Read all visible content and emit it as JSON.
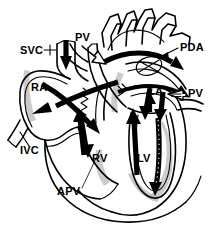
{
  "figure": {
    "type": "line-drawing",
    "background_color": "#ffffff",
    "ink_color": "#000000",
    "shade_color": "#b9b9b9",
    "width": 211,
    "height": 226
  },
  "labels": [
    {
      "id": "svc",
      "text": "SVC",
      "x": 20,
      "y": 54,
      "meaning": "superior-vena-cava"
    },
    {
      "id": "pv_top",
      "text": "PV",
      "x": 75,
      "y": 41,
      "meaning": "pulmonary-vein-upper"
    },
    {
      "id": "pda",
      "text": "PDA",
      "x": 180,
      "y": 51,
      "meaning": "patent-ductus-arteriosus"
    },
    {
      "id": "ra",
      "text": "RA",
      "x": 31,
      "y": 91,
      "meaning": "right-atrium"
    },
    {
      "id": "la",
      "text": "LA",
      "x": 148,
      "y": 95,
      "meaning": "left-atrium"
    },
    {
      "id": "pv_right",
      "text": "PV",
      "x": 188,
      "y": 97,
      "meaning": "pulmonary-vein-right"
    },
    {
      "id": "ivc",
      "text": "IVC",
      "x": 20,
      "y": 154,
      "meaning": "inferior-vena-cava"
    },
    {
      "id": "rv",
      "text": "RV",
      "x": 92,
      "y": 162,
      "meaning": "right-ventricle"
    },
    {
      "id": "lv",
      "text": "LV",
      "x": 137,
      "y": 162,
      "meaning": "left-ventricle"
    },
    {
      "id": "apv",
      "text": "APV",
      "x": 57,
      "y": 195,
      "meaning": "absent-pulmonary-valve"
    }
  ],
  "icons": {
    "flow_arrow": "blood-flow-arrow",
    "hollow_arrow": "pulmonary-vein-inflow-arrow",
    "leader_line": "label-leader-line"
  }
}
